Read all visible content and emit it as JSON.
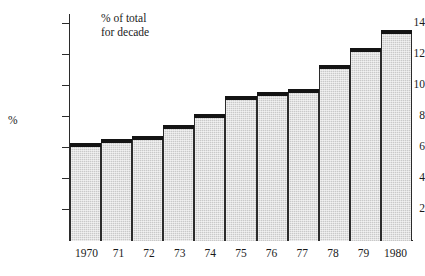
{
  "chart_data": {
    "type": "bar",
    "title": "",
    "subtitle": "",
    "annotation": "% of total\nfor decade",
    "xlabel": "",
    "ylabel": "%",
    "categories": [
      "1970",
      "71",
      "72",
      "73",
      "74",
      "75",
      "76",
      "77",
      "78",
      "79",
      "1980"
    ],
    "values": [
      6.3,
      6.6,
      6.8,
      7.5,
      8.2,
      9.4,
      9.6,
      9.8,
      11.4,
      12.5,
      13.6
    ],
    "series": [
      {
        "name": "% of total for decade",
        "values": [
          6.3,
          6.6,
          6.8,
          7.5,
          8.2,
          9.4,
          9.6,
          9.8,
          11.4,
          12.5,
          13.6
        ]
      }
    ],
    "ylim": [
      0,
      14.6
    ],
    "y_ticks": [
      2,
      4,
      6,
      8,
      10,
      12,
      14
    ],
    "y_tick_labels": [
      "2",
      "4",
      "6",
      "8",
      "10",
      "12",
      "14"
    ],
    "grid": false,
    "legend": false,
    "legend_position": "none",
    "bar_fill_color": "#c9c9c9",
    "bar_cap_color": "#141414",
    "axis_color": "#2b2b2b",
    "background_color": "#ffffff"
  },
  "axis": {
    "y_title": "%",
    "ticks": [
      {
        "label": "14",
        "value": 14
      },
      {
        "label": "12",
        "value": 12
      },
      {
        "label": "10",
        "value": 10
      },
      {
        "label": "8",
        "value": 8
      },
      {
        "label": "6",
        "value": 6
      },
      {
        "label": "4",
        "value": 4
      },
      {
        "label": "2",
        "value": 2
      }
    ]
  },
  "annotation": {
    "line1": "% of total",
    "line2": "for decade",
    "text": "% of total\nfor decade"
  }
}
